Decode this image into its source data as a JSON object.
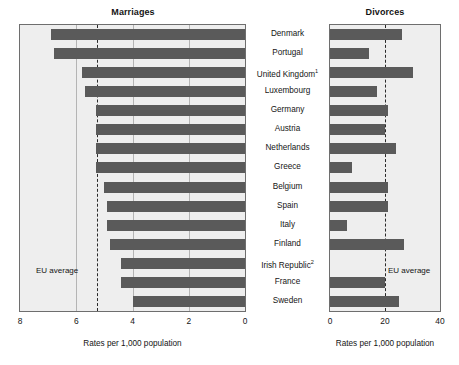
{
  "panels": {
    "marriages": {
      "title": "Marriages",
      "axis_caption": "Rates per 1,000 population",
      "ticks": [
        "8",
        "6",
        "4",
        "2",
        "0"
      ],
      "eu_average_label": "EU average"
    },
    "divorces": {
      "title": "Divorces",
      "axis_caption": "Rates per 1,000 population",
      "ticks": [
        "0",
        "20",
        "40"
      ],
      "eu_average_label": "EU average"
    }
  },
  "countries": [
    {
      "label": "Denmark",
      "footnote": ""
    },
    {
      "label": "Portugal",
      "footnote": ""
    },
    {
      "label": "United Kingdom",
      "footnote": "1"
    },
    {
      "label": "Luxembourg",
      "footnote": ""
    },
    {
      "label": "Germany",
      "footnote": ""
    },
    {
      "label": "Austria",
      "footnote": ""
    },
    {
      "label": "Netherlands",
      "footnote": ""
    },
    {
      "label": "Greece",
      "footnote": ""
    },
    {
      "label": "Belgium",
      "footnote": ""
    },
    {
      "label": "Spain",
      "footnote": ""
    },
    {
      "label": "Italy",
      "footnote": ""
    },
    {
      "label": "Finland",
      "footnote": ""
    },
    {
      "label": "Irish Republic",
      "footnote": "2"
    },
    {
      "label": "France",
      "footnote": ""
    },
    {
      "label": "Sweden",
      "footnote": ""
    }
  ],
  "chart_data": {
    "type": "bar",
    "orientation": "horizontal",
    "layout": "butterfly / back-to-back paired panels sharing category axis",
    "categories": [
      "Denmark",
      "Portugal",
      "United Kingdom",
      "Luxembourg",
      "Germany",
      "Austria",
      "Netherlands",
      "Greece",
      "Belgium",
      "Spain",
      "Italy",
      "Finland",
      "Irish Republic",
      "France",
      "Sweden"
    ],
    "series": [
      {
        "name": "Marriages",
        "panel": "left",
        "direction": "right-to-left",
        "xlabel": "Rates per 1,000 population",
        "xlim": [
          8,
          0
        ],
        "ticks": [
          8,
          6,
          4,
          2,
          0
        ],
        "grid": true,
        "reference_line": {
          "label": "EU average",
          "value": 5.25
        },
        "values": [
          6.9,
          6.8,
          5.8,
          5.7,
          5.3,
          5.3,
          5.3,
          5.3,
          5.0,
          4.9,
          4.9,
          4.8,
          4.4,
          4.4,
          4.0
        ]
      },
      {
        "name": "Divorces",
        "panel": "right",
        "direction": "left-to-right",
        "xlabel": "Rates per 1,000 population",
        "xlim": [
          0,
          40
        ],
        "ticks": [
          0,
          20,
          40
        ],
        "grid": false,
        "reference_line": {
          "label": "EU average",
          "value": 20
        },
        "values": [
          26,
          14,
          30,
          17,
          21,
          20,
          24,
          8,
          21,
          21,
          6,
          27,
          0,
          20,
          25
        ]
      }
    ],
    "footnotes": [
      "1",
      "2"
    ],
    "legend": "none"
  }
}
